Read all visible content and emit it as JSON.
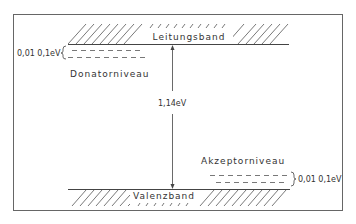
{
  "diagram": {
    "conduction_band": {
      "label": "Leitungsband"
    },
    "valence_band": {
      "label": "Valenzband"
    },
    "donor_level": {
      "label": "Donatorniveau",
      "range": "0,01 0,1eV"
    },
    "acceptor_level": {
      "label": "Akzeptorniveau",
      "range": "0,01 0,1eV"
    },
    "band_gap": {
      "label": "1,14eV"
    },
    "colors": {
      "line": "#444444",
      "background": "#ffffff"
    }
  }
}
